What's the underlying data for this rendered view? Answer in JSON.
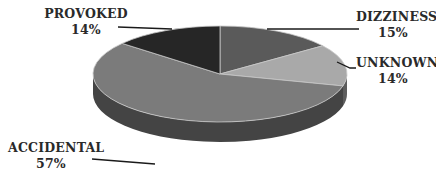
{
  "chart_data": {
    "type": "pie",
    "style": "3d",
    "title": "",
    "slices": [
      {
        "label": "DIZZINESS",
        "value": 15,
        "display": "15%",
        "color": "#5a5a5a"
      },
      {
        "label": "UNKNOWN",
        "value": 14,
        "display": "14%",
        "color": "#a9a9a9"
      },
      {
        "label": "ACCIDENTAL",
        "value": 57,
        "display": "57%",
        "color": "#7b7b7b"
      },
      {
        "label": "PROVOKED",
        "value": 14,
        "display": "14%",
        "color": "#262626"
      }
    ],
    "start_angle_deg": 0,
    "legend": "none",
    "data_labels": "outside with leader lines"
  },
  "labels": {
    "dizziness": {
      "name": "DIZZINESS",
      "pct": "15%"
    },
    "unknown": {
      "name": "UNKNOWN",
      "pct": "14%"
    },
    "accidental": {
      "name": "ACCIDENTAL",
      "pct": "57%"
    },
    "provoked": {
      "name": "PROVOKED",
      "pct": "14%"
    }
  }
}
